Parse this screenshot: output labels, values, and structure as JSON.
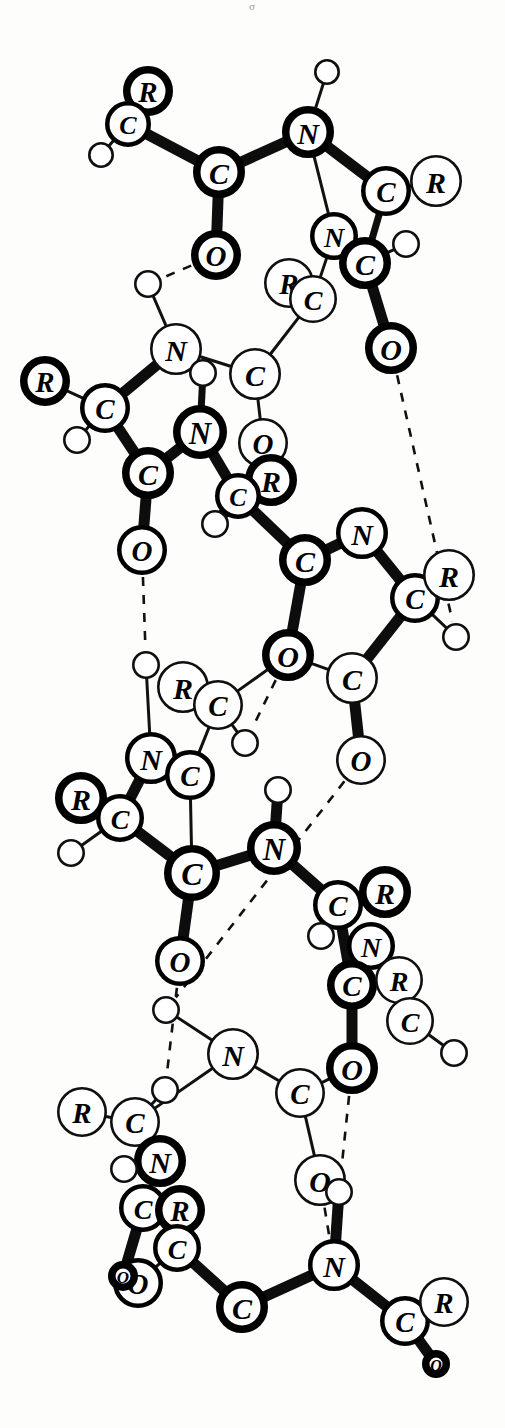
{
  "figure": {
    "top_mark": "σ",
    "background_color": "#fdfdfb",
    "ink_color": "#000000",
    "atom_types": [
      "C",
      "N",
      "O",
      "R",
      "H"
    ],
    "legend_note": "Solid bars = covalent bonds; dashed lines = hydrogen bonds"
  },
  "chart_data": {
    "type": "diagram",
    "atoms": [
      {
        "id": 1,
        "label": "R",
        "x": 148,
        "y": 91,
        "r": 25,
        "ring": "bold"
      },
      {
        "id": 2,
        "label": "C",
        "x": 128,
        "y": 124,
        "r": 23,
        "ring": "med"
      },
      {
        "id": 3,
        "label": "H",
        "x": 101,
        "y": 155,
        "r": 13,
        "ring": "thin"
      },
      {
        "id": 4,
        "label": "C",
        "x": 219,
        "y": 172,
        "r": 26,
        "ring": "bold"
      },
      {
        "id": 5,
        "label": "O",
        "x": 216,
        "y": 255,
        "r": 25,
        "ring": "bold"
      },
      {
        "id": 6,
        "label": "N",
        "x": 308,
        "y": 132,
        "r": 26,
        "ring": "bold"
      },
      {
        "id": 7,
        "label": "H",
        "x": 327,
        "y": 72,
        "r": 13,
        "ring": "thin"
      },
      {
        "id": 8,
        "label": "C",
        "x": 386,
        "y": 191,
        "r": 25,
        "ring": "med"
      },
      {
        "id": 9,
        "label": "R",
        "x": 436,
        "y": 181,
        "r": 26,
        "ring": "thin"
      },
      {
        "id": 10,
        "label": "N",
        "x": 334,
        "y": 236,
        "r": 24,
        "ring": "med"
      },
      {
        "id": 11,
        "label": "C",
        "x": 365,
        "y": 263,
        "r": 26,
        "ring": "bold"
      },
      {
        "id": 12,
        "label": "H",
        "x": 406,
        "y": 244,
        "r": 14,
        "ring": "thin"
      },
      {
        "id": 13,
        "label": "R",
        "x": 289,
        "y": 283,
        "r": 25,
        "ring": "thin"
      },
      {
        "id": 14,
        "label": "C",
        "x": 313,
        "y": 299,
        "r": 24,
        "ring": "thin"
      },
      {
        "id": 15,
        "label": "O",
        "x": 391,
        "y": 348,
        "r": 26,
        "ring": "bold"
      },
      {
        "id": 16,
        "label": "N",
        "x": 176,
        "y": 349,
        "r": 26,
        "ring": "thin"
      },
      {
        "id": 17,
        "label": "H",
        "x": 148,
        "y": 284,
        "r": 14,
        "ring": "thin"
      },
      {
        "id": 18,
        "label": "R",
        "x": 45,
        "y": 381,
        "r": 25,
        "ring": "bold"
      },
      {
        "id": 19,
        "label": "C",
        "x": 105,
        "y": 408,
        "r": 25,
        "ring": "med"
      },
      {
        "id": 20,
        "label": "H",
        "x": 77,
        "y": 440,
        "r": 14,
        "ring": "thin"
      },
      {
        "id": 21,
        "label": "C",
        "x": 148,
        "y": 473,
        "r": 26,
        "ring": "bold"
      },
      {
        "id": 22,
        "label": "O",
        "x": 142,
        "y": 550,
        "r": 25,
        "ring": "med"
      },
      {
        "id": 23,
        "label": "C",
        "x": 255,
        "y": 374,
        "r": 26,
        "ring": "thin"
      },
      {
        "id": 24,
        "label": "H",
        "x": 203,
        "y": 373,
        "r": 14,
        "ring": "thin"
      },
      {
        "id": 25,
        "label": "N",
        "x": 200,
        "y": 432,
        "r": 27,
        "ring": "bold"
      },
      {
        "id": 26,
        "label": "O",
        "x": 263,
        "y": 443,
        "r": 25,
        "ring": "thin"
      },
      {
        "id": 27,
        "label": "R",
        "x": 271,
        "y": 480,
        "r": 26,
        "ring": "bold"
      },
      {
        "id": 28,
        "label": "C",
        "x": 238,
        "y": 496,
        "r": 23,
        "ring": "med"
      },
      {
        "id": 29,
        "label": "H",
        "x": 215,
        "y": 524,
        "r": 14,
        "ring": "thin"
      },
      {
        "id": 30,
        "label": "C",
        "x": 305,
        "y": 560,
        "r": 26,
        "ring": "bold"
      },
      {
        "id": 31,
        "label": "N",
        "x": 362,
        "y": 533,
        "r": 26,
        "ring": "med"
      },
      {
        "id": 32,
        "label": "C",
        "x": 415,
        "y": 598,
        "r": 25,
        "ring": "med"
      },
      {
        "id": 33,
        "label": "R",
        "x": 449,
        "y": 575,
        "r": 26,
        "ring": "thin"
      },
      {
        "id": 34,
        "label": "H",
        "x": 456,
        "y": 637,
        "r": 14,
        "ring": "thin"
      },
      {
        "id": 35,
        "label": "O",
        "x": 288,
        "y": 655,
        "r": 26,
        "ring": "bold"
      },
      {
        "id": 36,
        "label": "C",
        "x": 352,
        "y": 678,
        "r": 26,
        "ring": "thin"
      },
      {
        "id": 37,
        "label": "O",
        "x": 361,
        "y": 760,
        "r": 25,
        "ring": "thin"
      },
      {
        "id": 38,
        "label": "R",
        "x": 183,
        "y": 687,
        "r": 26,
        "ring": "thin"
      },
      {
        "id": 39,
        "label": "C",
        "x": 218,
        "y": 705,
        "r": 25,
        "ring": "thin"
      },
      {
        "id": 40,
        "label": "H",
        "x": 146,
        "y": 665,
        "r": 14,
        "ring": "thin"
      },
      {
        "id": 41,
        "label": "H",
        "x": 245,
        "y": 743,
        "r": 14,
        "ring": "thin"
      },
      {
        "id": 42,
        "label": "N",
        "x": 151,
        "y": 758,
        "r": 26,
        "ring": "med"
      },
      {
        "id": 43,
        "label": "C",
        "x": 190,
        "y": 775,
        "r": 25,
        "ring": "med"
      },
      {
        "id": 44,
        "label": "R",
        "x": 81,
        "y": 798,
        "r": 26,
        "ring": "bold"
      },
      {
        "id": 45,
        "label": "C",
        "x": 120,
        "y": 818,
        "r": 24,
        "ring": "med"
      },
      {
        "id": 46,
        "label": "H",
        "x": 71,
        "y": 853,
        "r": 14,
        "ring": "thin"
      },
      {
        "id": 47,
        "label": "C",
        "x": 192,
        "y": 873,
        "r": 28,
        "ring": "bold"
      },
      {
        "id": 48,
        "label": "N",
        "x": 274,
        "y": 848,
        "r": 27,
        "ring": "bold"
      },
      {
        "id": 49,
        "label": "H",
        "x": 278,
        "y": 790,
        "r": 14,
        "ring": "thin"
      },
      {
        "id": 50,
        "label": "O",
        "x": 180,
        "y": 961,
        "r": 25,
        "ring": "med"
      },
      {
        "id": 51,
        "label": "C",
        "x": 338,
        "y": 905,
        "r": 25,
        "ring": "med"
      },
      {
        "id": 52,
        "label": "R",
        "x": 385,
        "y": 892,
        "r": 26,
        "ring": "bold"
      },
      {
        "id": 53,
        "label": "H",
        "x": 321,
        "y": 936,
        "r": 14,
        "ring": "thin"
      },
      {
        "id": 54,
        "label": "N",
        "x": 371,
        "y": 946,
        "r": 24,
        "ring": "med"
      },
      {
        "id": 55,
        "label": "C",
        "x": 352,
        "y": 985,
        "r": 25,
        "ring": "bold"
      },
      {
        "id": 56,
        "label": "R",
        "x": 399,
        "y": 980,
        "r": 24,
        "ring": "thin"
      },
      {
        "id": 57,
        "label": "C",
        "x": 410,
        "y": 1021,
        "r": 24,
        "ring": "thin"
      },
      {
        "id": 58,
        "label": "H",
        "x": 454,
        "y": 1053,
        "r": 14,
        "ring": "thin"
      },
      {
        "id": 59,
        "label": "O",
        "x": 352,
        "y": 1068,
        "r": 26,
        "ring": "bold"
      },
      {
        "id": 60,
        "label": "N",
        "x": 233,
        "y": 1054,
        "r": 26,
        "ring": "thin"
      },
      {
        "id": 61,
        "label": "H",
        "x": 166,
        "y": 1010,
        "r": 14,
        "ring": "thin"
      },
      {
        "id": 62,
        "label": "C",
        "x": 300,
        "y": 1093,
        "r": 25,
        "ring": "thin"
      },
      {
        "id": 63,
        "label": "R",
        "x": 82,
        "y": 1112,
        "r": 25,
        "ring": "thin"
      },
      {
        "id": 64,
        "label": "C",
        "x": 135,
        "y": 1122,
        "r": 25,
        "ring": "thin"
      },
      {
        "id": 65,
        "label": "H",
        "x": 165,
        "y": 1090,
        "r": 14,
        "ring": "thin"
      },
      {
        "id": 66,
        "label": "N",
        "x": 160,
        "y": 1161,
        "r": 26,
        "ring": "bold"
      },
      {
        "id": 67,
        "label": "H",
        "x": 124,
        "y": 1169,
        "r": 14,
        "ring": "thin"
      },
      {
        "id": 68,
        "label": "C",
        "x": 143,
        "y": 1208,
        "r": 24,
        "ring": "med"
      },
      {
        "id": 69,
        "label": "R",
        "x": 180,
        "y": 1210,
        "r": 25,
        "ring": "bold"
      },
      {
        "id": 70,
        "label": "C",
        "x": 177,
        "y": 1248,
        "r": 24,
        "ring": "med"
      },
      {
        "id": 71,
        "label": "O",
        "x": 138,
        "y": 1283,
        "r": 25,
        "ring": "med"
      },
      {
        "id": 72,
        "label": "O",
        "x": 123,
        "y": 1276,
        "r": 15,
        "ring": "bold"
      },
      {
        "id": 73,
        "label": "O",
        "x": 320,
        "y": 1180,
        "r": 26,
        "ring": "thin"
      },
      {
        "id": 74,
        "label": "H",
        "x": 339,
        "y": 1192,
        "r": 14,
        "ring": "thin"
      },
      {
        "id": 75,
        "label": "N",
        "x": 334,
        "y": 1265,
        "r": 26,
        "ring": "med"
      },
      {
        "id": 76,
        "label": "C",
        "x": 242,
        "y": 1307,
        "r": 26,
        "ring": "bold"
      },
      {
        "id": 77,
        "label": "C",
        "x": 405,
        "y": 1321,
        "r": 25,
        "ring": "med"
      },
      {
        "id": 78,
        "label": "R",
        "x": 444,
        "y": 1302,
        "r": 25,
        "ring": "thin"
      },
      {
        "id": 79,
        "label": "O",
        "x": 436,
        "y": 1364,
        "r": 14,
        "ring": "bold"
      }
    ],
    "bonds": [
      {
        "from": 2,
        "to": 1,
        "type": "thick"
      },
      {
        "from": 2,
        "to": 3,
        "type": "thin"
      },
      {
        "from": 2,
        "to": 4,
        "type": "thick"
      },
      {
        "from": 4,
        "to": 5,
        "type": "thick"
      },
      {
        "from": 4,
        "to": 6,
        "type": "thick"
      },
      {
        "from": 6,
        "to": 7,
        "type": "thin"
      },
      {
        "from": 6,
        "to": 8,
        "type": "thick"
      },
      {
        "from": 6,
        "to": 10,
        "type": "thin"
      },
      {
        "from": 8,
        "to": 9,
        "type": "thin"
      },
      {
        "from": 8,
        "to": 11,
        "type": "medium"
      },
      {
        "from": 11,
        "to": 12,
        "type": "thin"
      },
      {
        "from": 11,
        "to": 15,
        "type": "thick"
      },
      {
        "from": 10,
        "to": 14,
        "type": "thin"
      },
      {
        "from": 14,
        "to": 13,
        "type": "thin"
      },
      {
        "from": 14,
        "to": 23,
        "type": "thin"
      },
      {
        "from": 16,
        "to": 17,
        "type": "thin"
      },
      {
        "from": 16,
        "to": 19,
        "type": "thick"
      },
      {
        "from": 16,
        "to": 23,
        "type": "thin"
      },
      {
        "from": 19,
        "to": 18,
        "type": "thin"
      },
      {
        "from": 19,
        "to": 20,
        "type": "thin"
      },
      {
        "from": 19,
        "to": 21,
        "type": "thick"
      },
      {
        "from": 21,
        "to": 22,
        "type": "thick"
      },
      {
        "from": 21,
        "to": 25,
        "type": "thick"
      },
      {
        "from": 23,
        "to": 26,
        "type": "thin"
      },
      {
        "from": 25,
        "to": 24,
        "type": "medium"
      },
      {
        "from": 25,
        "to": 28,
        "type": "thick"
      },
      {
        "from": 28,
        "to": 27,
        "type": "thin"
      },
      {
        "from": 28,
        "to": 29,
        "type": "thick"
      },
      {
        "from": 28,
        "to": 30,
        "type": "thick"
      },
      {
        "from": 30,
        "to": 31,
        "type": "thick"
      },
      {
        "from": 30,
        "to": 35,
        "type": "thick"
      },
      {
        "from": 31,
        "to": 32,
        "type": "thick"
      },
      {
        "from": 32,
        "to": 33,
        "type": "thin"
      },
      {
        "from": 32,
        "to": 34,
        "type": "thin"
      },
      {
        "from": 32,
        "to": 36,
        "type": "thick"
      },
      {
        "from": 36,
        "to": 37,
        "type": "thick"
      },
      {
        "from": 35,
        "to": 36,
        "type": "thin"
      },
      {
        "from": 39,
        "to": 38,
        "type": "thin"
      },
      {
        "from": 39,
        "to": 35,
        "type": "thin"
      },
      {
        "from": 39,
        "to": 41,
        "type": "thin"
      },
      {
        "from": 39,
        "to": 43,
        "type": "thin"
      },
      {
        "from": 42,
        "to": 40,
        "type": "thin"
      },
      {
        "from": 42,
        "to": 43,
        "type": "thin"
      },
      {
        "from": 42,
        "to": 45,
        "type": "thick"
      },
      {
        "from": 45,
        "to": 44,
        "type": "thin"
      },
      {
        "from": 45,
        "to": 46,
        "type": "thin"
      },
      {
        "from": 45,
        "to": 47,
        "type": "thick"
      },
      {
        "from": 47,
        "to": 43,
        "type": "thin"
      },
      {
        "from": 47,
        "to": 48,
        "type": "thick"
      },
      {
        "from": 47,
        "to": 50,
        "type": "thick"
      },
      {
        "from": 48,
        "to": 49,
        "type": "thick"
      },
      {
        "from": 48,
        "to": 51,
        "type": "thick"
      },
      {
        "from": 51,
        "to": 52,
        "type": "thin"
      },
      {
        "from": 51,
        "to": 53,
        "type": "thin"
      },
      {
        "from": 51,
        "to": 55,
        "type": "thick"
      },
      {
        "from": 55,
        "to": 54,
        "type": "thin"
      },
      {
        "from": 55,
        "to": 59,
        "type": "thick"
      },
      {
        "from": 57,
        "to": 56,
        "type": "thin"
      },
      {
        "from": 57,
        "to": 54,
        "type": "thin"
      },
      {
        "from": 57,
        "to": 58,
        "type": "thin"
      },
      {
        "from": 60,
        "to": 61,
        "type": "thin"
      },
      {
        "from": 60,
        "to": 62,
        "type": "thin"
      },
      {
        "from": 60,
        "to": 64,
        "type": "thin"
      },
      {
        "from": 62,
        "to": 59,
        "type": "thin"
      },
      {
        "from": 62,
        "to": 73,
        "type": "thin"
      },
      {
        "from": 64,
        "to": 63,
        "type": "thin"
      },
      {
        "from": 64,
        "to": 65,
        "type": "thin"
      },
      {
        "from": 64,
        "to": 66,
        "type": "thick"
      },
      {
        "from": 66,
        "to": 67,
        "type": "thin"
      },
      {
        "from": 66,
        "to": 68,
        "type": "thin"
      },
      {
        "from": 68,
        "to": 69,
        "type": "thin"
      },
      {
        "from": 68,
        "to": 72,
        "type": "thick"
      },
      {
        "from": 70,
        "to": 69,
        "type": "thin"
      },
      {
        "from": 70,
        "to": 71,
        "type": "thin"
      },
      {
        "from": 70,
        "to": 76,
        "type": "thick"
      },
      {
        "from": 76,
        "to": 75,
        "type": "thick"
      },
      {
        "from": 75,
        "to": 74,
        "type": "thick"
      },
      {
        "from": 75,
        "to": 77,
        "type": "thick"
      },
      {
        "from": 77,
        "to": 78,
        "type": "thin"
      },
      {
        "from": 77,
        "to": 79,
        "type": "thick"
      }
    ],
    "hydrogen_bonds": [
      {
        "from": 5,
        "to": 17
      },
      {
        "from": 15,
        "to": 34
      },
      {
        "from": 22,
        "to": 40
      },
      {
        "from": 35,
        "to": 41
      },
      {
        "from": 37,
        "to": 61
      },
      {
        "from": 50,
        "to": 65
      },
      {
        "from": 59,
        "to": 74
      },
      {
        "from": 73,
        "to": 75
      }
    ],
    "xlabel": "",
    "ylabel": "",
    "grid": false,
    "legend": false
  }
}
